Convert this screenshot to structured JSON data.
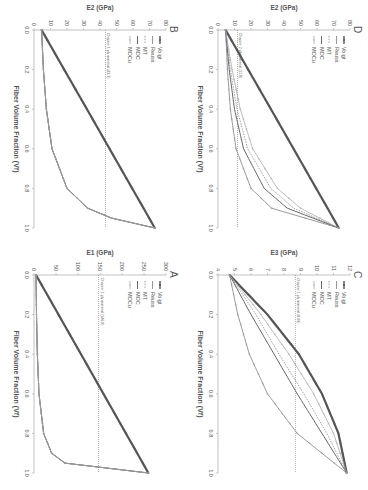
{
  "figure": {
    "orientation": "rotated 90deg clockwise",
    "colors": {
      "voigt": "#555555",
      "reuss": "#999999",
      "mt": "#888888",
      "moc": "#666666",
      "mocu": "#aaaaaa",
      "ref": "#777777",
      "axis": "#999999",
      "text": "#555555"
    }
  },
  "chart_data": [
    {
      "panel": "A",
      "type": "line",
      "title": "A",
      "xlabel": "Fiber Volume Fraction (Vf)",
      "ylabel": "E1 (GPa)",
      "xlim": [
        0,
        1
      ],
      "ylim": [
        0,
        300
      ],
      "xticks": [
        "0.0",
        "0.2",
        "0.4",
        "0.6",
        "0.8",
        "1.0"
      ],
      "yticks": [
        "0",
        "50",
        "100",
        "150",
        "200",
        "250",
        "300"
      ],
      "legend": [
        "Voigt",
        "Reuss",
        "MT",
        "MOC",
        "MOCu"
      ],
      "legend_position": "upper left",
      "reference_line": {
        "y": 146.8,
        "label": "Chapter 1 ply material (146.8)"
      },
      "x": [
        0,
        0.2,
        0.4,
        0.6,
        0.8,
        0.9,
        0.95,
        1.0
      ],
      "series": [
        {
          "name": "Voigt",
          "values": [
            4.6,
            55.7,
            106.8,
            157.8,
            208.9,
            234.5,
            247.2,
            260
          ]
        },
        {
          "name": "Reuss",
          "values": [
            4.6,
            5.7,
            7.6,
            11.3,
            21.8,
            40,
            70,
            260
          ]
        },
        {
          "name": "MT",
          "values": [
            4.6,
            5.8,
            7.8,
            11.6,
            22.5,
            41,
            72,
            260
          ]
        },
        {
          "name": "MOC",
          "values": [
            4.6,
            5.7,
            7.6,
            11.3,
            21.8,
            40,
            70,
            260
          ]
        },
        {
          "name": "MOCu",
          "values": [
            4.6,
            5.7,
            7.6,
            11.3,
            21.8,
            40,
            70,
            260
          ]
        }
      ]
    },
    {
      "panel": "B",
      "type": "line",
      "title": "B",
      "xlabel": "Fiber Volume Fraction (Vf)",
      "ylabel": "E2 (GPa)",
      "xlim": [
        0,
        1
      ],
      "ylim": [
        0,
        80
      ],
      "xticks": [
        "0.0",
        "0.2",
        "0.4",
        "0.6",
        "0.8",
        "1.0"
      ],
      "yticks": [
        "0",
        "10",
        "20",
        "30",
        "40",
        "50",
        "60",
        "70",
        "80"
      ],
      "legend": [
        "Voigt",
        "Reuss",
        "MT",
        "MOC",
        "MOCu"
      ],
      "legend_position": "upper left",
      "reference_line": {
        "y": 43.3,
        "label": "Chapter 1 ply material (43.3)"
      },
      "x": [
        0,
        0.2,
        0.4,
        0.6,
        0.8,
        0.9,
        0.95,
        1.0
      ],
      "series": [
        {
          "name": "Voigt",
          "values": [
            4.6,
            18.3,
            32.1,
            45.8,
            59.5,
            66.4,
            69.8,
            73.2
          ]
        },
        {
          "name": "Reuss",
          "values": [
            4.6,
            5.7,
            7.5,
            10.9,
            20,
            32.5,
            47,
            73.2
          ]
        },
        {
          "name": "MT",
          "values": [
            4.6,
            5.7,
            7.5,
            10.9,
            20,
            32.5,
            47,
            73.2
          ]
        },
        {
          "name": "MOC",
          "values": [
            4.6,
            5.7,
            7.5,
            10.9,
            20,
            32.5,
            47,
            73.2
          ]
        },
        {
          "name": "MOCu",
          "values": [
            4.6,
            5.7,
            7.5,
            10.9,
            20,
            32.5,
            47,
            73.2
          ]
        }
      ]
    },
    {
      "panel": "C",
      "type": "line",
      "title": "C",
      "xlabel": "Fiber Volume Fraction (Vf)",
      "ylabel": "E3 (GPa)",
      "xlim": [
        0,
        1
      ],
      "ylim": [
        4,
        12
      ],
      "xticks": [
        "0.0",
        "0.2",
        "0.4",
        "0.6",
        "0.8",
        "1.0"
      ],
      "yticks": [
        "4",
        "5",
        "6",
        "7",
        "8",
        "9",
        "10",
        "11",
        "12"
      ],
      "legend": [
        "Voigt",
        "Reuss",
        "MT",
        "MOC",
        "MOCu"
      ],
      "legend_position": "upper left",
      "reference_line": {
        "y": 8.69,
        "label": "Chapter 1 ply material (8.69)"
      },
      "x": [
        0,
        0.2,
        0.4,
        0.6,
        0.8,
        1.0
      ],
      "series": [
        {
          "name": "Voigt",
          "values": [
            4.7,
            7.0,
            8.9,
            10.3,
            11.3,
            11.8
          ]
        },
        {
          "name": "Reuss",
          "values": [
            4.7,
            5.2,
            5.9,
            7.0,
            8.8,
            11.8
          ]
        },
        {
          "name": "MT",
          "values": [
            4.7,
            6.3,
            7.7,
            9.2,
            10.6,
            11.8
          ]
        },
        {
          "name": "MOC",
          "values": [
            4.7,
            6.0,
            7.4,
            8.8,
            10.3,
            11.8
          ]
        },
        {
          "name": "MOCu",
          "values": [
            4.7,
            6.6,
            8.3,
            9.8,
            11.0,
            11.8
          ]
        }
      ]
    },
    {
      "panel": "D",
      "type": "line",
      "title": "D",
      "xlabel": "Fiber Volume Fraction (Vf)",
      "ylabel": "E2 (GPa)",
      "xlim": [
        0,
        1
      ],
      "ylim": [
        0,
        80
      ],
      "xticks": [
        "0.0",
        "0.2",
        "0.4",
        "0.6",
        "0.8",
        "1.0"
      ],
      "yticks": [
        "0",
        "10",
        "20",
        "30",
        "40",
        "50",
        "60",
        "70",
        "80"
      ],
      "legend": [
        "Voigt",
        "Reuss",
        "MT",
        "MOC",
        "MOCu"
      ],
      "legend_position": "upper left",
      "reference_line": {
        "y": 11.8,
        "label": "Chapter 2 ply material (11.8)"
      },
      "x": [
        0,
        0.2,
        0.4,
        0.6,
        0.8,
        0.9,
        1.0
      ],
      "series": [
        {
          "name": "Voigt",
          "values": [
            4.6,
            18.3,
            32.1,
            45.8,
            59.5,
            66.4,
            73.2
          ]
        },
        {
          "name": "Reuss",
          "values": [
            4.6,
            5.7,
            7.5,
            10.9,
            20,
            32.5,
            73.2
          ]
        },
        {
          "name": "MT",
          "values": [
            4.6,
            7.5,
            11.5,
            18,
            32,
            46,
            73.2
          ]
        },
        {
          "name": "MOC",
          "values": [
            4.6,
            6.8,
            10,
            15.5,
            28,
            42,
            73.2
          ]
        },
        {
          "name": "MOCu",
          "values": [
            4.6,
            8.5,
            13.5,
            21,
            36,
            50,
            73.2
          ]
        }
      ]
    }
  ],
  "caption": ""
}
